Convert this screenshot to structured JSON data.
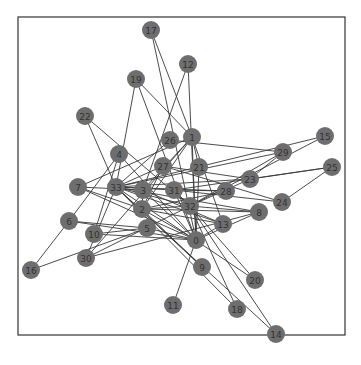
{
  "figure": {
    "type": "network-graph",
    "frame": {
      "x": 18,
      "y": 17,
      "width": 327,
      "height": 318
    },
    "node_color": "#6e6e6e",
    "edge_color": "#3a3a3a",
    "label_color": "#333333",
    "node_radius": 9
  },
  "nodes": [
    {
      "id": "0",
      "label": "0",
      "x": 196,
      "y": 240
    },
    {
      "id": "1",
      "label": "1",
      "x": 192,
      "y": 137
    },
    {
      "id": "2",
      "label": "2",
      "x": 142,
      "y": 209
    },
    {
      "id": "3",
      "label": "3",
      "x": 143,
      "y": 190
    },
    {
      "id": "4",
      "label": "4",
      "x": 119,
      "y": 154
    },
    {
      "id": "5",
      "label": "5",
      "x": 147,
      "y": 228
    },
    {
      "id": "6",
      "label": "6",
      "x": 69,
      "y": 221
    },
    {
      "id": "7",
      "label": "7",
      "x": 78,
      "y": 187
    },
    {
      "id": "8",
      "label": "8",
      "x": 259,
      "y": 212
    },
    {
      "id": "9",
      "label": "9",
      "x": 202,
      "y": 267
    },
    {
      "id": "10",
      "label": "10",
      "x": 94,
      "y": 234
    },
    {
      "id": "11",
      "label": "11",
      "x": 173,
      "y": 305
    },
    {
      "id": "12",
      "label": "12",
      "x": 188,
      "y": 64
    },
    {
      "id": "13",
      "label": "13",
      "x": 223,
      "y": 224
    },
    {
      "id": "14",
      "label": "14",
      "x": 276,
      "y": 334
    },
    {
      "id": "15",
      "label": "15",
      "x": 325,
      "y": 136
    },
    {
      "id": "16",
      "label": "16",
      "x": 31,
      "y": 270
    },
    {
      "id": "17",
      "label": "17",
      "x": 151,
      "y": 30
    },
    {
      "id": "18",
      "label": "18",
      "x": 237,
      "y": 309
    },
    {
      "id": "19",
      "label": "19",
      "x": 136,
      "y": 79
    },
    {
      "id": "20",
      "label": "20",
      "x": 255,
      "y": 280
    },
    {
      "id": "21",
      "label": "21",
      "x": 199,
      "y": 167
    },
    {
      "id": "22",
      "label": "22",
      "x": 85,
      "y": 116
    },
    {
      "id": "23",
      "label": "23",
      "x": 250,
      "y": 179
    },
    {
      "id": "24",
      "label": "24",
      "x": 282,
      "y": 202
    },
    {
      "id": "25",
      "label": "25",
      "x": 332,
      "y": 167
    },
    {
      "id": "26",
      "label": "26",
      "x": 170,
      "y": 140
    },
    {
      "id": "27",
      "label": "27",
      "x": 163,
      "y": 166
    },
    {
      "id": "28",
      "label": "28",
      "x": 226,
      "y": 191
    },
    {
      "id": "29",
      "label": "29",
      "x": 283,
      "y": 152
    },
    {
      "id": "30",
      "label": "30",
      "x": 86,
      "y": 258
    },
    {
      "id": "31",
      "label": "31",
      "x": 174,
      "y": 190
    },
    {
      "id": "32",
      "label": "32",
      "x": 190,
      "y": 206
    },
    {
      "id": "33",
      "label": "33",
      "x": 116,
      "y": 187
    }
  ],
  "edges": [
    [
      "0",
      "1"
    ],
    [
      "0",
      "2"
    ],
    [
      "0",
      "3"
    ],
    [
      "0",
      "4"
    ],
    [
      "0",
      "5"
    ],
    [
      "0",
      "6"
    ],
    [
      "0",
      "7"
    ],
    [
      "0",
      "8"
    ],
    [
      "0",
      "10"
    ],
    [
      "0",
      "11"
    ],
    [
      "0",
      "12"
    ],
    [
      "0",
      "13"
    ],
    [
      "0",
      "17"
    ],
    [
      "0",
      "19"
    ],
    [
      "0",
      "21"
    ],
    [
      "0",
      "31"
    ],
    [
      "1",
      "2"
    ],
    [
      "1",
      "3"
    ],
    [
      "1",
      "7"
    ],
    [
      "1",
      "13"
    ],
    [
      "1",
      "17"
    ],
    [
      "1",
      "19"
    ],
    [
      "1",
      "21"
    ],
    [
      "1",
      "30"
    ],
    [
      "2",
      "3"
    ],
    [
      "2",
      "7"
    ],
    [
      "2",
      "8"
    ],
    [
      "2",
      "9"
    ],
    [
      "2",
      "13"
    ],
    [
      "2",
      "27"
    ],
    [
      "2",
      "28"
    ],
    [
      "2",
      "32"
    ],
    [
      "3",
      "7"
    ],
    [
      "3",
      "12"
    ],
    [
      "3",
      "13"
    ],
    [
      "4",
      "6"
    ],
    [
      "4",
      "10"
    ],
    [
      "5",
      "6"
    ],
    [
      "5",
      "10"
    ],
    [
      "5",
      "16"
    ],
    [
      "6",
      "16"
    ],
    [
      "8",
      "30"
    ],
    [
      "8",
      "32"
    ],
    [
      "8",
      "33"
    ],
    [
      "9",
      "33"
    ],
    [
      "13",
      "33"
    ],
    [
      "14",
      "32"
    ],
    [
      "14",
      "33"
    ],
    [
      "15",
      "32"
    ],
    [
      "15",
      "33"
    ],
    [
      "18",
      "32"
    ],
    [
      "18",
      "33"
    ],
    [
      "19",
      "33"
    ],
    [
      "20",
      "32"
    ],
    [
      "20",
      "33"
    ],
    [
      "22",
      "32"
    ],
    [
      "22",
      "33"
    ],
    [
      "23",
      "25"
    ],
    [
      "23",
      "27"
    ],
    [
      "23",
      "29"
    ],
    [
      "23",
      "32"
    ],
    [
      "23",
      "33"
    ],
    [
      "24",
      "25"
    ],
    [
      "24",
      "27"
    ],
    [
      "24",
      "31"
    ],
    [
      "25",
      "31"
    ],
    [
      "26",
      "29"
    ],
    [
      "26",
      "33"
    ],
    [
      "27",
      "33"
    ],
    [
      "28",
      "31"
    ],
    [
      "28",
      "33"
    ],
    [
      "29",
      "32"
    ],
    [
      "29",
      "33"
    ],
    [
      "30",
      "32"
    ],
    [
      "30",
      "33"
    ],
    [
      "31",
      "32"
    ],
    [
      "31",
      "33"
    ],
    [
      "32",
      "33"
    ]
  ]
}
